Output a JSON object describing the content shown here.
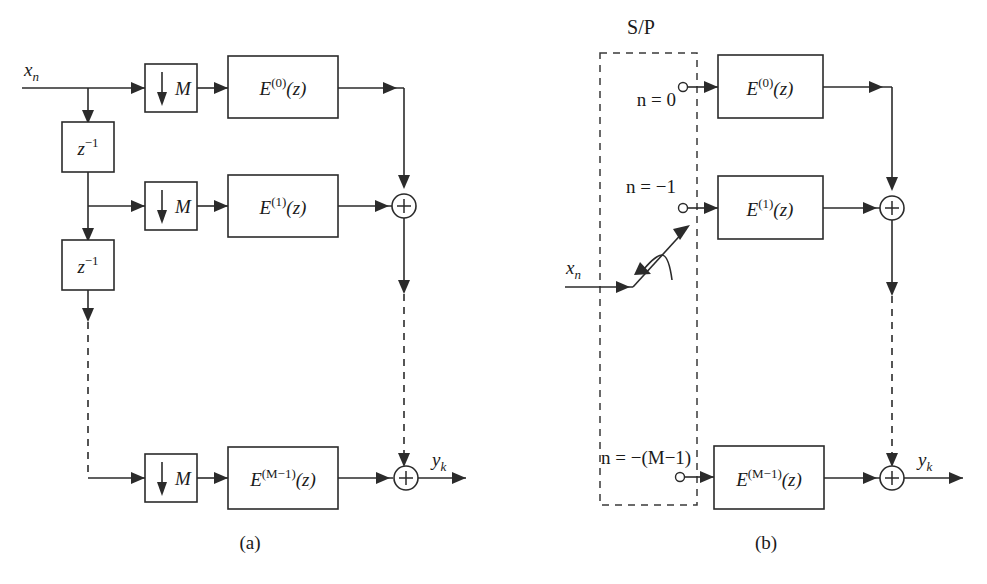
{
  "figure": {
    "background_color": "#ffffff",
    "line_color": "#2b2b2b",
    "panels": [
      {
        "id": "a",
        "caption": "(a)",
        "input_label": "x",
        "input_label_sub": "n",
        "output_label": "y",
        "output_label_sub": "k",
        "delay_label_base": "z",
        "delay_label_exp": "−1",
        "downsampler_label": "M",
        "downsampler_arrow": "down-arrow-glyph",
        "adder_symbol": "+",
        "branches": [
          {
            "filter_base": "E",
            "filter_exp": "(0)",
            "filter_arg": "(z)",
            "decimator": "M"
          },
          {
            "filter_base": "E",
            "filter_exp": "(1)",
            "filter_arg": "(z)",
            "decimator": "M"
          },
          {
            "filter_base": "E",
            "filter_exp": "(M−1)",
            "filter_arg": "(z)",
            "decimator": "M"
          }
        ],
        "delays": [
          {
            "base": "z",
            "exp": "−1"
          },
          {
            "base": "z",
            "exp": "−1"
          }
        ]
      },
      {
        "id": "b",
        "caption": "(b)",
        "input_label": "x",
        "input_label_sub": "n",
        "output_label": "y",
        "output_label_sub": "k",
        "block_label": "S/P",
        "adder_symbol": "+",
        "commutator": "rotary-switch",
        "branches": [
          {
            "tap_label": "n = 0",
            "filter_base": "E",
            "filter_exp": "(0)",
            "filter_arg": "(z)"
          },
          {
            "tap_label": "n = −1",
            "filter_base": "E",
            "filter_exp": "(1)",
            "filter_arg": "(z)"
          },
          {
            "tap_label": "n = −(M−1)",
            "filter_base": "E",
            "filter_exp": "(M−1)",
            "filter_arg": "(z)"
          }
        ]
      }
    ]
  }
}
